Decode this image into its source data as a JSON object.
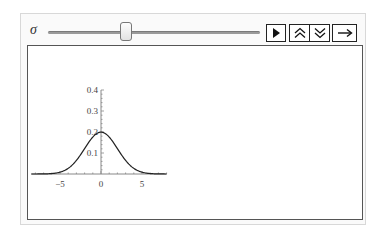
{
  "control": {
    "parameter_label": "σ",
    "slider_value": 2,
    "slider_min": 0.5,
    "slider_max": 10
  },
  "buttons": {
    "play": "play-icon",
    "faster": "double-chevron-up-icon",
    "slower": "double-chevron-down-icon",
    "direction": "right-arrow-icon"
  },
  "chart_data": {
    "type": "line",
    "title": "",
    "xlabel": "",
    "ylabel": "",
    "function": "normal pdf, mean 0, sigma 2",
    "x_ticks": [
      "−5",
      "0",
      "5"
    ],
    "y_ticks": [
      "0.1",
      "0.2",
      "0.3",
      "0.4"
    ],
    "xlim": [
      -8.5,
      8
    ],
    "ylim": [
      0,
      0.4
    ],
    "series": [
      {
        "name": "pdf",
        "x": [
          -8,
          -6,
          -5,
          -4,
          -3,
          -2,
          -1,
          0,
          1,
          2,
          3,
          4,
          5,
          6,
          8
        ],
        "values": [
          0.0,
          0.0022,
          0.0088,
          0.027,
          0.0648,
          0.121,
          0.176,
          0.1995,
          0.176,
          0.121,
          0.0648,
          0.027,
          0.0088,
          0.0022,
          0.0
        ]
      }
    ],
    "grid": false,
    "colors": {
      "curve": "#222222",
      "axes": "#888888"
    }
  }
}
